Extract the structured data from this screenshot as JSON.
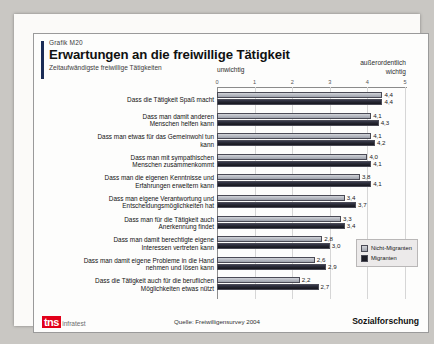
{
  "header": {
    "graphic_no": "Grafik M20",
    "title": "Erwartungen an die freiwillige Tätigkeit",
    "subtitle": "Zeitaufwändigste freiwillige Tätigkeiten"
  },
  "axis_captions": {
    "left": "unwichtig",
    "right_line1": "außerordentlich",
    "right_line2": "wichtig"
  },
  "legend": {
    "items": [
      {
        "label": "Nicht-Migranten",
        "color": "#b9bcc4"
      },
      {
        "label": "Migranten",
        "color": "#1b1c25"
      }
    ]
  },
  "footer": {
    "logo_mark": "tns",
    "logo_word": "infratest",
    "source": "Quelle: Freiwilligensurvey 2004",
    "division": "Sozialforschung"
  },
  "chart_data": {
    "type": "bar",
    "orientation": "horizontal",
    "title": "Erwartungen an die freiwillige Tätigkeit",
    "subtitle": "Zeitaufwändigste freiwillige Tätigkeiten",
    "xlabel": "",
    "ylabel": "",
    "xlim": [
      0,
      5
    ],
    "xticks": [
      0,
      1,
      2,
      3,
      4,
      5
    ],
    "xtick_labels": [
      "0",
      "1",
      "2",
      "3",
      "4",
      "5"
    ],
    "axis_low_label": "unwichtig",
    "axis_high_label": "außerordentlich wichtig",
    "grid": true,
    "legend_position": "right-bottom",
    "source": "Quelle: Freiwilligensurvey 2004",
    "categories": [
      "Dass die Tätigkeit Spaß macht",
      "Dass man damit anderen\nMenschen helfen kann",
      "Dass man etwas für das Gemeinwohl tun\nkann",
      "Dass man mit sympathischen\nMenschen zusammenkommt",
      "Dass man die eigenen Kenntnisse und\nErfahrungen erweitern kann",
      "Dass man eigene Verantwortung und\nEntscheidungsmöglichkeiten hat",
      "Dass man für die Tätigkeit auch\nAnerkennung findet",
      "Dass man damit berechtigte eigene\nInteressen vertreten kann",
      "Dass man damit eigene Probleme in die Hand\nnehmen und lösen kann",
      "Dass die Tätigkeit auch für die beruflichen\nMöglichkeiten etwas nützt"
    ],
    "series": [
      {
        "name": "Nicht-Migranten",
        "values": [
          4.4,
          4.1,
          4.1,
          4.0,
          3.8,
          3.4,
          3.3,
          2.8,
          2.6,
          2.2
        ],
        "labels": [
          "4,4",
          "4,1",
          "4,1",
          "4,0",
          "3,8",
          "3,4",
          "3,3",
          "2,8",
          "2,6",
          "2,2"
        ]
      },
      {
        "name": "Migranten",
        "values": [
          4.4,
          4.3,
          4.2,
          4.1,
          4.1,
          3.7,
          3.4,
          3.0,
          2.9,
          2.7
        ],
        "labels": [
          "4,4",
          "4,3",
          "4,2",
          "4,1",
          "4,1",
          "3,7",
          "3,4",
          "3,0",
          "2,9",
          "2,7"
        ]
      }
    ]
  }
}
